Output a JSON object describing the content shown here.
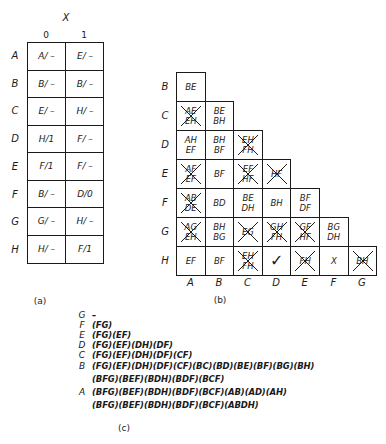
{
  "table_a": {
    "input_var": "X",
    "columns": [
      "0",
      "1"
    ],
    "rows": [
      {
        "state": "A",
        "cells": [
          "A/ –",
          "E/ –"
        ]
      },
      {
        "state": "B",
        "cells": [
          "B/ –",
          "B/ –"
        ]
      },
      {
        "state": "C",
        "cells": [
          "E/ –",
          "H/ –"
        ]
      },
      {
        "state": "D",
        "cells": [
          "H/1",
          "F/ –"
        ]
      },
      {
        "state": "E",
        "cells": [
          "F/1",
          "F/ –"
        ]
      },
      {
        "state": "F",
        "cells": [
          "B/ –",
          "D/0"
        ]
      },
      {
        "state": "G",
        "cells": [
          "G/ –",
          "H/ –"
        ]
      },
      {
        "state": "H",
        "cells": [
          "H/ –",
          "F/1"
        ]
      }
    ],
    "caption": "(a)"
  },
  "table_b": {
    "row_labels": [
      "B",
      "C",
      "D",
      "E",
      "F",
      "G",
      "H"
    ],
    "col_labels": [
      "A",
      "B",
      "C",
      "D",
      "E",
      "F",
      "G"
    ],
    "rows": [
      [
        {
          "text": [
            "BE"
          ],
          "crossed": false
        }
      ],
      [
        {
          "text": [
            "AE",
            "EH"
          ],
          "crossed": true
        },
        {
          "text": [
            "BE",
            "BH"
          ],
          "crossed": false
        }
      ],
      [
        {
          "text": [
            "AH",
            "EF"
          ],
          "crossed": false
        },
        {
          "text": [
            "BH",
            "BF"
          ],
          "crossed": false
        },
        {
          "text": [
            "EH",
            "FH"
          ],
          "crossed": true
        }
      ],
      [
        {
          "text": [
            "AF",
            "EF"
          ],
          "crossed": true
        },
        {
          "text": [
            "BF"
          ],
          "crossed": false
        },
        {
          "text": [
            "EF",
            "HF"
          ],
          "crossed": true
        },
        {
          "text": [
            "HF"
          ],
          "crossed": true
        }
      ],
      [
        {
          "text": [
            "AB",
            "DE"
          ],
          "crossed": true
        },
        {
          "text": [
            "BD"
          ],
          "crossed": false
        },
        {
          "text": [
            "BE",
            "DH"
          ],
          "crossed": false
        },
        {
          "text": [
            "BH"
          ],
          "crossed": false
        },
        {
          "text": [
            "BF",
            "DF"
          ],
          "crossed": false
        }
      ],
      [
        {
          "text": [
            "AG",
            "EH"
          ],
          "crossed": true
        },
        {
          "text": [
            "BH",
            "BG"
          ],
          "crossed": false
        },
        {
          "text": [
            "EG"
          ],
          "crossed": true
        },
        {
          "text": [
            "GH",
            "FH"
          ],
          "crossed": true
        },
        {
          "text": [
            "GF",
            "HF"
          ],
          "crossed": true
        },
        {
          "text": [
            "BG",
            "DH"
          ],
          "crossed": false
        }
      ],
      [
        {
          "text": [
            "EF"
          ],
          "crossed": false
        },
        {
          "text": [
            "BF"
          ],
          "crossed": false
        },
        {
          "text": [
            "EH",
            "FH"
          ],
          "crossed": true
        },
        {
          "text": [
            "✓"
          ],
          "crossed": false,
          "check": true
        },
        {
          "text": [
            "FH"
          ],
          "crossed": true
        },
        {
          "text": [
            "X"
          ],
          "crossed": false
        },
        {
          "text": [
            "BH"
          ],
          "crossed": true
        }
      ]
    ],
    "caption": "(b)"
  },
  "table_c": {
    "lines": [
      {
        "label": "G",
        "text": "–"
      },
      {
        "label": "F",
        "text": "(FG)"
      },
      {
        "label": "E",
        "text": "(FG)(EF)"
      },
      {
        "label": "D",
        "text": "(FG)(EF)(DH)(DF)"
      },
      {
        "label": "C",
        "text": "(FG)(EF)(DH)(DF)(CF)"
      },
      {
        "label": "B",
        "text": "(FG)(EF)(DH)(DF)(CF)(BC)(BD)(BE)(BF)(BG)(BH)"
      },
      {
        "label": "",
        "text": "(BFG)(BEF)(BDH)(BDF)(BCF)"
      },
      {
        "label": "A",
        "text": "(BFG)(BEF)(BDH)(BDF)(BCF)(AB)(AD)(AH)"
      },
      {
        "label": "",
        "text": "(BFG)(BEF)(BDH)(BDF)(BCF)(ABDH)"
      }
    ],
    "caption": "(c)"
  }
}
